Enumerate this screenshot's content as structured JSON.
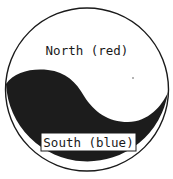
{
  "diagram": {
    "type": "yin-yang-division",
    "regions": [
      {
        "id": "north",
        "label": "North (red)",
        "fill": "#ffffff"
      },
      {
        "id": "south",
        "label": "South (blue)",
        "fill": "#1c1c1c"
      }
    ],
    "outline_color": "#1a1a1a"
  }
}
